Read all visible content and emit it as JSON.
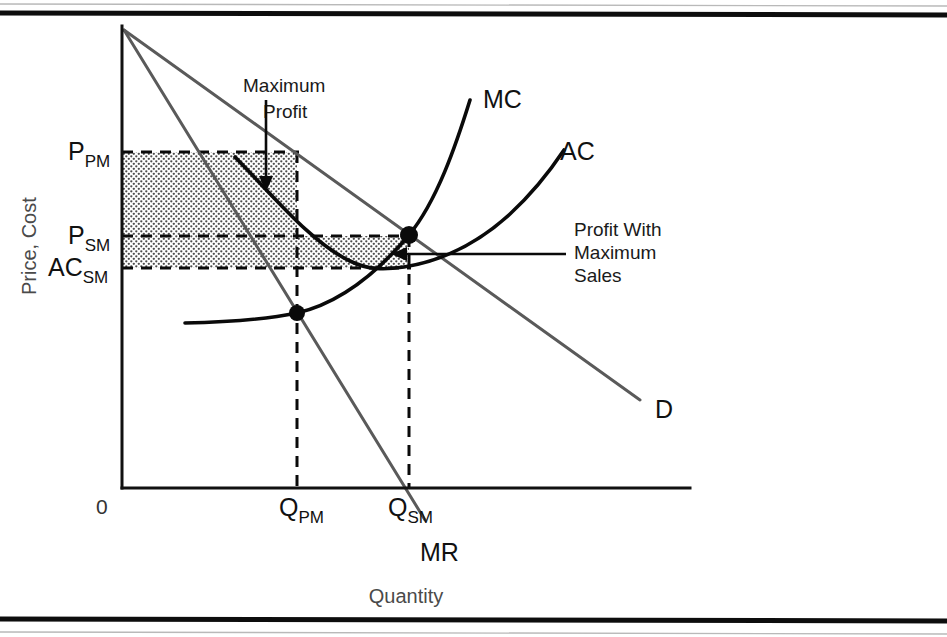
{
  "figure": {
    "background_color": "#ffffff",
    "frame": {
      "top_rule_y": 13,
      "bottom_rule_y": 618,
      "rule_color": "#0d0d0d"
    }
  },
  "axes": {
    "y_axis_title": "Price, Cost",
    "x_axis_title": "Quantity",
    "origin_label": "0",
    "x_axis": {
      "x_start": 122,
      "x_end": 690,
      "y": 488
    },
    "y_axis": {
      "x": 122,
      "y_top": 26,
      "y_bottom": 488
    }
  },
  "y_ticks": [
    {
      "id": "p-pm",
      "base": "P",
      "sub": "PM",
      "y": 152,
      "label_x": 68
    },
    {
      "id": "p-sm",
      "base": "P",
      "sub": "SM",
      "y": 236,
      "label_x": 68
    },
    {
      "id": "ac-sm",
      "base": "AC",
      "sub": "SM",
      "y": 268,
      "label_x": 48
    }
  ],
  "x_ticks": [
    {
      "id": "q-pm",
      "base": "Q",
      "sub": "PM",
      "x": 297,
      "label_x": 279
    },
    {
      "id": "q-sm",
      "base": "Q",
      "sub": "SM",
      "x": 409,
      "label_x": 388
    }
  ],
  "curves": [
    {
      "id": "demand",
      "label": "D",
      "label_x": 655,
      "label_y": 418,
      "color": "#5a5a5a",
      "path": "M 124 30 L 640 400"
    },
    {
      "id": "marginal-revenue",
      "label": "MR",
      "label_x": 420,
      "label_y": 561,
      "color": "#5a5a5a",
      "path": "M 124 30 L 425 520"
    },
    {
      "id": "marginal-cost",
      "label": "MC",
      "label_x": 483,
      "label_y": 108,
      "color": "#0a0a0a",
      "path": "M 185 323 C 230 322, 268 319, 297 313 C 340 303, 378 272, 409 235 C 437 201, 456 145, 470 100"
    },
    {
      "id": "average-cost",
      "label": "AC",
      "label_x": 560,
      "label_y": 160,
      "color": "#0a0a0a",
      "path": "M 235 157 C 277 200, 312 243, 350 261 C 368 270, 384 270, 404 267 C 442 261, 478 243, 510 214 C 536 190, 552 168, 564 150"
    }
  ],
  "equilibrium_points": [
    {
      "id": "profit-max-point",
      "x": 297,
      "y": 313,
      "radius": 8
    },
    {
      "id": "sales-max-point",
      "x": 409,
      "y": 235,
      "radius": 9
    }
  ],
  "shaded_regions": [
    {
      "id": "profit-max-area",
      "x": 122,
      "y": 152,
      "width": 175,
      "height": 84,
      "fill_color": "#dedede"
    },
    {
      "id": "sales-max-profit-area",
      "x": 122,
      "y": 236,
      "width": 287,
      "height": 32,
      "fill_color": "#d6d6d6"
    }
  ],
  "dashed_guides": [
    {
      "id": "p-pm-horizontal",
      "path": "M 122 152 L 299 152"
    },
    {
      "id": "p-sm-horizontal",
      "path": "M 122 236 L 411 236"
    },
    {
      "id": "ac-sm-horizontal",
      "path": "M 122 268 L 411 268"
    },
    {
      "id": "q-pm-vertical",
      "path": "M 297 152 L 297 488"
    },
    {
      "id": "q-sm-vertical",
      "path": "M 409 236 L 409 488"
    }
  ],
  "annotations": [
    {
      "id": "maximum-profit",
      "line1": "Maximum",
      "line2": "Profit",
      "text_x": 243,
      "text_y": 92,
      "text_x2": 263,
      "text_y2": 118,
      "arrow_path": "M 266 100 L 266 183",
      "arrow_head": "266,192 259,176 273,176"
    },
    {
      "id": "profit-with-maximum-sales",
      "line1": "Profit With",
      "line2": "Maximum",
      "line3": "Sales",
      "text_x": 574,
      "text_y": 236,
      "text_y2": 259,
      "text_y3": 282,
      "arrow_path": "M 566 254 L 400 254",
      "arrow_head": "391,254 407,247 407,261"
    }
  ]
}
